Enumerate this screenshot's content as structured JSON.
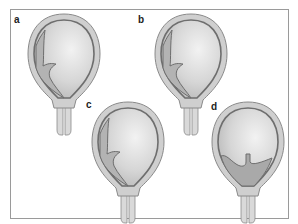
{
  "figure": {
    "panels": [
      {
        "id": "a",
        "label": "a",
        "state": "membrane partially detached along left wall"
      },
      {
        "id": "b",
        "label": "b",
        "state": "membrane partially detached along left wall"
      },
      {
        "id": "c",
        "label": "c",
        "state": "membrane partially detached along left wall"
      },
      {
        "id": "d",
        "label": "d",
        "state": "collection pooled at lower uterus"
      }
    ],
    "colors": {
      "frame": "#9a9a9a",
      "outer_wall": "#c8c8c8",
      "inner_line": "#6e6e6e",
      "cavity_light": "#eeeeee",
      "cavity_dark": "#bdbdbd",
      "collection": "#a9a9a9",
      "label": "#222222"
    }
  }
}
